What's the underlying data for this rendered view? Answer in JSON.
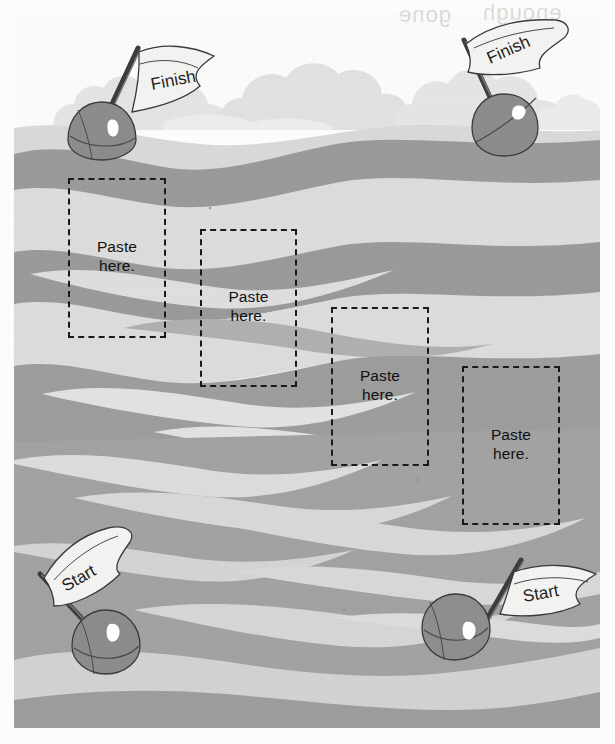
{
  "page": {
    "background_color": "#fdfdfc"
  },
  "palette": {
    "sky": "#fbfbfa",
    "cloud": "#e2e2e0",
    "cloud_shadow": "#d6d6d4",
    "water_dark": "#949494",
    "water_mid": "#a9a9a9",
    "water_light": "#d2d2d0",
    "water_pale": "#e0e0de",
    "buoy_fill": "#8e8e8e",
    "buoy_shade": "#7d7d7d",
    "buoy_highlight": "#ffffff",
    "flag_fill": "#f2f2f0",
    "ink": "#2b2b2b",
    "dash_ink": "#1a1a1a"
  },
  "scene": {
    "name": "ocean-race-course",
    "horizon_y": 118
  },
  "buoys": [
    {
      "id": "buoy-finish-left",
      "label": "Finish",
      "position": "top-left",
      "flag_rotation_deg": -9,
      "x": 50,
      "y": 88,
      "flag_x": 108,
      "flag_y": 38
    },
    {
      "id": "buoy-finish-right",
      "label": "Finish",
      "position": "top-right",
      "flag_rotation_deg": -22,
      "x": 458,
      "y": 84,
      "flag_x": 448,
      "flag_y": 18
    },
    {
      "id": "buoy-start-left",
      "label": "Start",
      "position": "bottom-left",
      "flag_rotation_deg": -26,
      "x": 48,
      "y": 600,
      "flag_x": 50,
      "flag_y": 528
    },
    {
      "id": "buoy-start-right",
      "label": "Start",
      "position": "bottom-right",
      "flag_rotation_deg": -12,
      "x": 414,
      "y": 592,
      "flag_x": 462,
      "flag_y": 542
    }
  ],
  "paste_boxes": [
    {
      "id": "paste-box-1",
      "line1": "Paste",
      "line2": "here.",
      "x": 68,
      "y": 178,
      "w": 98,
      "h": 160
    },
    {
      "id": "paste-box-2",
      "line1": "Paste",
      "line2": "here.",
      "x": 200,
      "y": 229,
      "w": 97,
      "h": 158
    },
    {
      "id": "paste-box-3",
      "line1": "Paste",
      "line2": "here.",
      "x": 331,
      "y": 307,
      "w": 98,
      "h": 159
    },
    {
      "id": "paste-box-4",
      "line1": "Paste",
      "line2": "here.",
      "x": 462,
      "y": 366,
      "w": 98,
      "h": 159
    }
  ],
  "bleed_through": [
    {
      "text": "gone",
      "x": 398,
      "y": 6
    },
    {
      "text": "enough",
      "x": 480,
      "y": 4
    }
  ]
}
